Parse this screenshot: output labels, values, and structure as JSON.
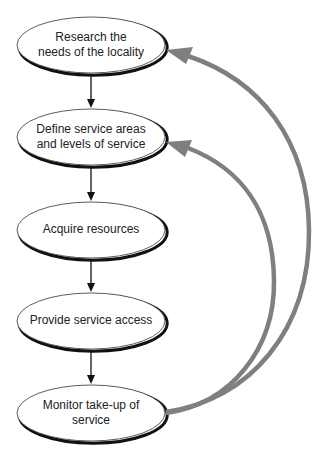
{
  "diagram": {
    "type": "flowchart",
    "colors": {
      "node_stroke": "#111111",
      "flow_arrow": "#111111",
      "feedback_arrow": "#7f7f7f",
      "background": "#ffffff"
    },
    "nodes": [
      {
        "id": "research",
        "label_line1": "Research the",
        "label_line2": "needs of the locality"
      },
      {
        "id": "define",
        "label_line1": "Define service areas",
        "label_line2": "and levels of service"
      },
      {
        "id": "acquire",
        "label_line1": "Acquire resources",
        "label_line2": ""
      },
      {
        "id": "provide",
        "label_line1": "Provide service access",
        "label_line2": ""
      },
      {
        "id": "monitor",
        "label_line1": "Monitor take-up of",
        "label_line2": "service"
      }
    ],
    "edges": [
      {
        "from": "research",
        "to": "define",
        "style": "flow"
      },
      {
        "from": "define",
        "to": "acquire",
        "style": "flow"
      },
      {
        "from": "acquire",
        "to": "provide",
        "style": "flow"
      },
      {
        "from": "provide",
        "to": "monitor",
        "style": "flow"
      },
      {
        "from": "monitor",
        "to": "research",
        "style": "feedback"
      },
      {
        "from": "monitor",
        "to": "define",
        "style": "feedback"
      }
    ]
  }
}
